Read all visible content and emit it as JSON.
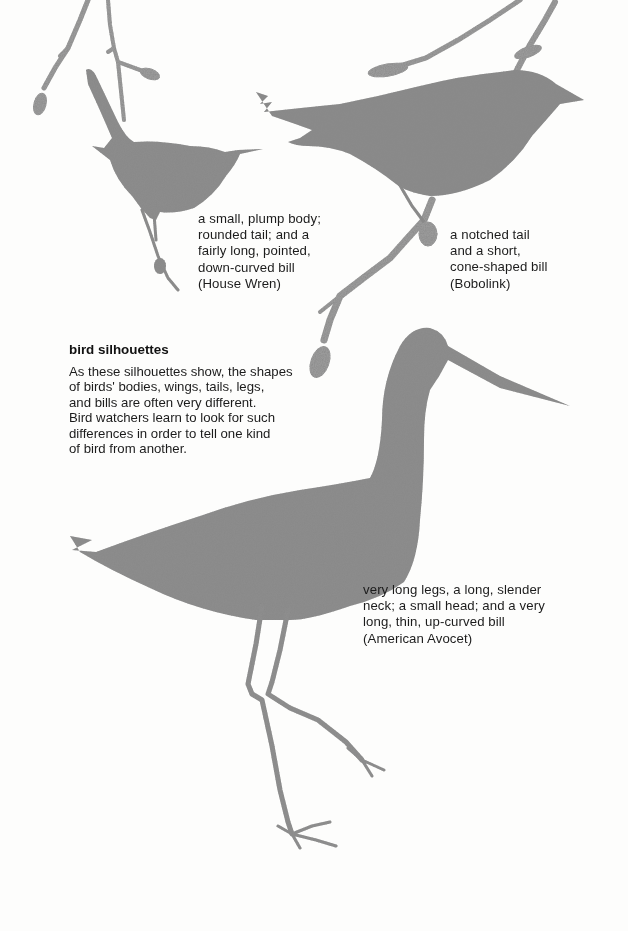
{
  "page": {
    "heading": "bird silhouettes",
    "intro_lines": [
      "As these silhouettes show, the shapes",
      "of birds' bodies, wings, tails, legs,",
      "and bills are often very different.",
      "Bird watchers learn to look for such",
      "differences in order to tell one kind",
      "of bird from another."
    ]
  },
  "birds": [
    {
      "id": "house-wren",
      "name": "House Wren",
      "caption_lines": [
        "a small, plump body;",
        "rounded tail; and a",
        "fairly long, pointed,",
        "down-curved bill",
        "(House Wren)"
      ]
    },
    {
      "id": "bobolink",
      "name": "Bobolink",
      "caption_lines": [
        "a notched tail",
        "and a short,",
        "cone-shaped bill",
        "(Bobolink)"
      ]
    },
    {
      "id": "american-avocet",
      "name": "American Avocet",
      "caption_lines": [
        "very long legs, a long, slender",
        "neck; a small head; and a very",
        "long, thin, up-curved bill",
        "(American Avocet)"
      ]
    }
  ],
  "colors": {
    "background": "#fdfdfc",
    "silhouette": "#8a8a8a",
    "text": "#1c1c1c"
  }
}
